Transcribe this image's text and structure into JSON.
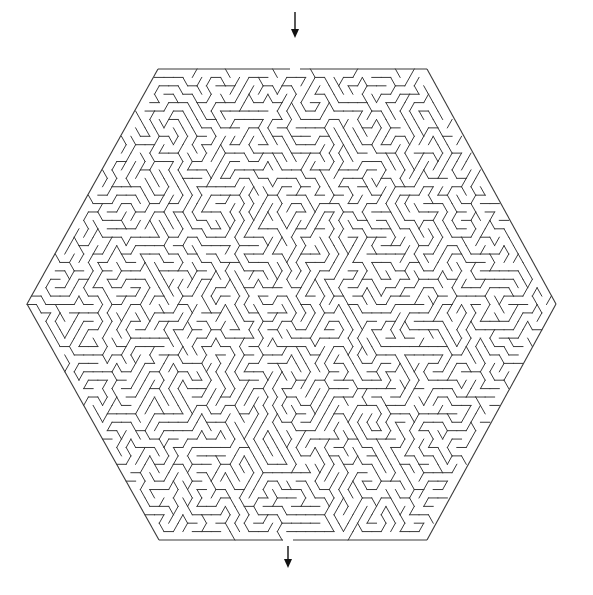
{
  "puzzle": {
    "type": "hexagonal-maze",
    "background_color": "#ffffff",
    "wall_color": "#3a3a3a",
    "arrow_color": "#111111",
    "hexagon": {
      "vertices": [
        [
          158,
          69
        ],
        [
          427,
          69
        ],
        [
          556,
          304
        ],
        [
          427,
          540
        ],
        [
          159,
          540
        ],
        [
          27,
          304
        ]
      ]
    },
    "entrance": {
      "label": "start",
      "gap_x": [
        290,
        300
      ],
      "edge": "top",
      "arrow": {
        "x": 295,
        "y1": 12,
        "y2": 38,
        "direction": "down"
      }
    },
    "exit": {
      "label": "finish",
      "gap_x": [
        283,
        293
      ],
      "edge": "bottom",
      "arrow": {
        "x": 288,
        "y1": 546,
        "y2": 568,
        "direction": "down"
      }
    },
    "cell_size": 9.2,
    "seed": 4217
  }
}
